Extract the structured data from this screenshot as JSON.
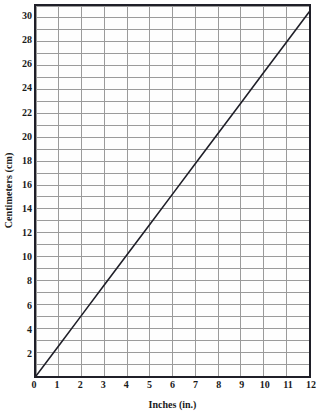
{
  "chart_data": {
    "type": "line",
    "title": "",
    "subtitle": "",
    "xlabel": "Inches (in.)",
    "ylabel": "Centimeters (cm)",
    "xlim": [
      0,
      12
    ],
    "ylim": [
      0,
      31
    ],
    "grid": true,
    "legend": null,
    "x_major_step": 1,
    "y_major_step": 1,
    "x_tick_labels": [
      "0",
      "1",
      "2",
      "3",
      "4",
      "5",
      "6",
      "7",
      "8",
      "9",
      "10",
      "11",
      "12"
    ],
    "x_tick_values": [
      0,
      1,
      2,
      3,
      4,
      5,
      6,
      7,
      8,
      9,
      10,
      11,
      12
    ],
    "y_tick_labels": [
      "2",
      "4",
      "6",
      "8",
      "10",
      "12",
      "14",
      "16",
      "18",
      "20",
      "22",
      "24",
      "26",
      "28",
      "30"
    ],
    "y_tick_values": [
      2,
      4,
      6,
      8,
      10,
      12,
      14,
      16,
      18,
      20,
      22,
      24,
      26,
      28,
      30
    ],
    "series": [
      {
        "name": "inches-to-centimeters",
        "x": [
          0,
          1,
          2,
          3,
          4,
          5,
          6,
          7,
          8,
          9,
          10,
          11,
          12
        ],
        "values": [
          0,
          2.54,
          5.08,
          7.62,
          10.16,
          12.7,
          15.24,
          17.78,
          20.32,
          22.86,
          25.4,
          27.94,
          30.48
        ],
        "color": "#1f1f28"
      }
    ],
    "colors": {
      "line": "#1f1f28",
      "grid_major": "#9a9a9a",
      "axis_frame": "#1f1f28",
      "plot_background": "#fefefe",
      "text": "#1a1a1a"
    }
  },
  "axes": {
    "x_title": "Inches (in.)",
    "y_title": "Centimeters (cm)"
  }
}
